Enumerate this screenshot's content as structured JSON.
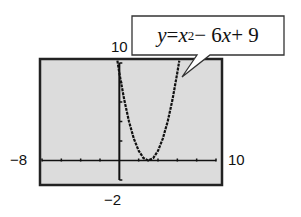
{
  "chart_data": {
    "type": "line",
    "title": "",
    "equation": "y = x^2 - 6x + 9",
    "equation_parts": {
      "lhs": "y",
      "equals": " = ",
      "var": "x",
      "exp": "2",
      "rest_minus": " − 6",
      "var2": "x",
      "rest_plus": " + 9"
    },
    "series": [
      {
        "name": "y = x^2 - 6x + 9",
        "x": [
          -0.2,
          0,
          0.5,
          1,
          1.5,
          2,
          2.5,
          3,
          3.5,
          4,
          4.5,
          5,
          5.5,
          6,
          6.2
        ],
        "y": [
          10.24,
          9,
          6.25,
          4,
          2.25,
          1,
          0.25,
          0,
          0.25,
          1,
          2.25,
          4,
          6.25,
          9,
          10.24
        ]
      }
    ],
    "xlim": [
      -8,
      10
    ],
    "ylim": [
      -2,
      10
    ],
    "xscale": 2,
    "yscale": 2,
    "window_labels": {
      "xmin": "−8",
      "xmax": "10",
      "ymin": "−2",
      "ymax": "10"
    },
    "vertex": [
      3,
      0
    ],
    "grid": false,
    "background": "#dcdcdc",
    "frame_color": "#222222",
    "curve_color": "#111111"
  }
}
